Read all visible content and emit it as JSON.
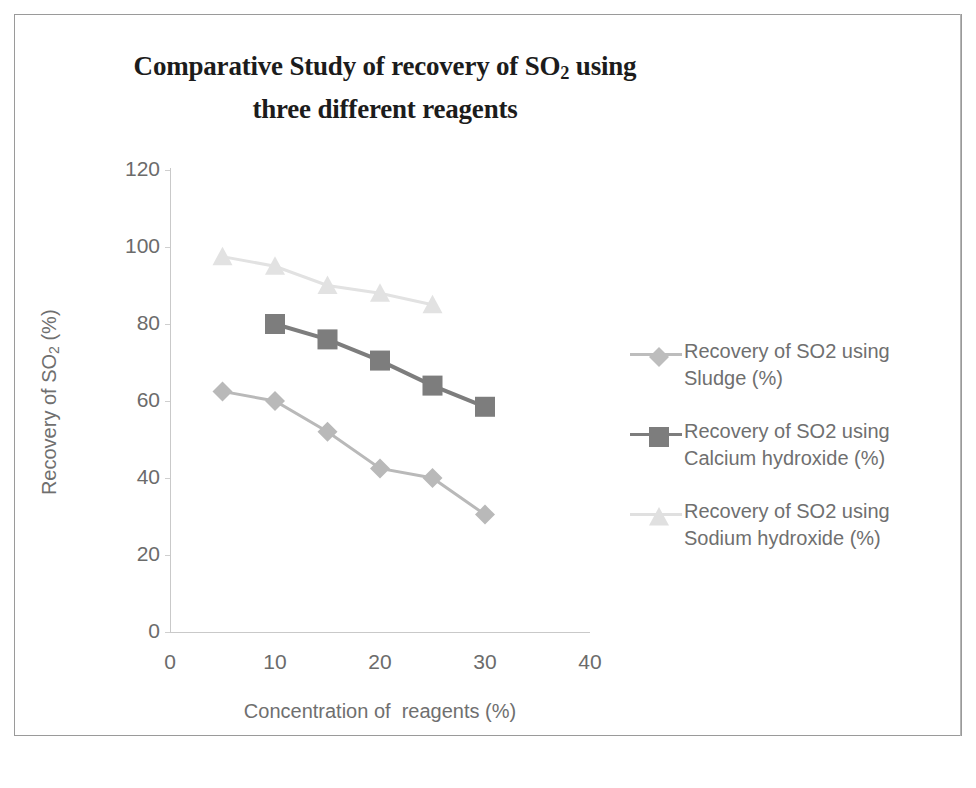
{
  "chart_data": {
    "type": "line",
    "title": "Comparative Study of recovery of SO2 using three different reagents",
    "title_parts": {
      "line1_before": "Comparative Study of recovery of SO",
      "line1_sub": "2",
      "line1_after": " using",
      "line2": "three different reagents"
    },
    "xlabel": "Concentration of  reagents (%)",
    "ylabel_before": "Recovery of SO",
    "ylabel_sub": "2",
    "ylabel_after": "  (%)",
    "ylabel": "Recovery of SO2  (%)",
    "xlim": [
      0,
      40
    ],
    "ylim": [
      0,
      120
    ],
    "xticks": [
      0,
      10,
      20,
      30,
      40
    ],
    "yticks": [
      0,
      20,
      40,
      60,
      80,
      100,
      120
    ],
    "grid": false,
    "legend_position": "right",
    "series": [
      {
        "name": "Recovery of SO2 using Sludge (%)",
        "marker": "diamond",
        "color": "#b9b9b9",
        "x": [
          5,
          10,
          15,
          20,
          25,
          30
        ],
        "values": [
          62.5,
          60,
          52,
          42.5,
          40,
          30.5
        ]
      },
      {
        "name": "Recovery of SO2 using Calcium hydroxide (%)",
        "marker": "square",
        "color": "#7d7d7d",
        "x": [
          10,
          15,
          20,
          25,
          30
        ],
        "values": [
          80,
          76,
          70.5,
          64,
          58.5
        ]
      },
      {
        "name": "Recovery of SO2 using Sodium hydroxide (%)",
        "marker": "triangle",
        "color": "#e2e2e2",
        "x": [
          5,
          10,
          15,
          20,
          25
        ],
        "values": [
          97.5,
          95,
          90,
          88,
          85
        ]
      }
    ]
  },
  "legend": {
    "items": [
      {
        "label": "Recovery of SO2 using Sludge (%)",
        "marker": "diamond",
        "color": "#bdbdbd"
      },
      {
        "label": "Recovery of SO2 using Calcium hydroxide (%)",
        "marker": "square",
        "color": "#7d7d7d"
      },
      {
        "label": "Recovery of SO2 using Sodium hydroxide (%)",
        "marker": "triangle",
        "color": "#e0e0e0"
      }
    ]
  },
  "colors": {
    "sludge": "#bdbdbd",
    "calcium_hydroxide": "#7d7d7d",
    "sodium_hydroxide": "#e0e0e0",
    "axis": "#c9c9c9",
    "tick_text": "#6b6b6b",
    "title": "#1c1c1c"
  }
}
